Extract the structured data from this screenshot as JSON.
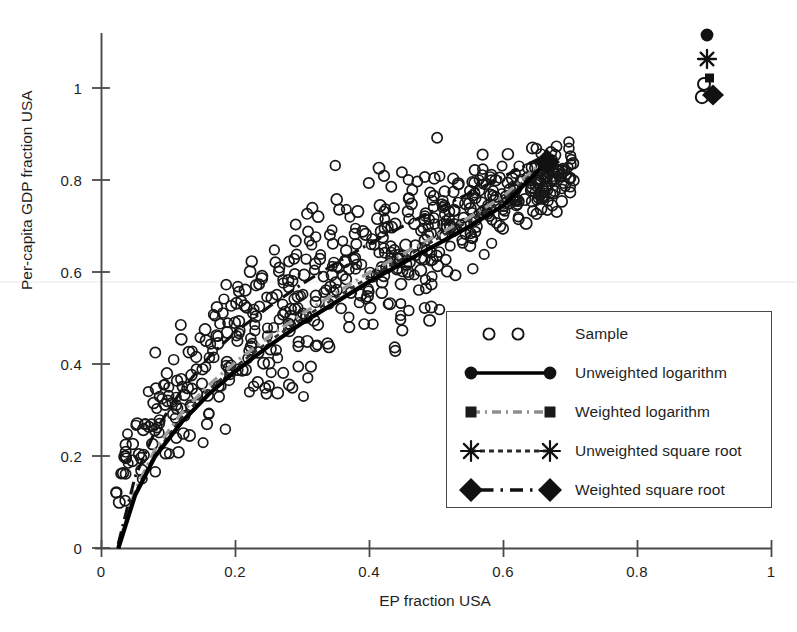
{
  "chart_data": {
    "type": "scatter",
    "title": "",
    "xlabel": "EP fraction USA",
    "ylabel": "Per-capita GDP fraction USA",
    "xlim": [
      0,
      1
    ],
    "ylim": [
      0,
      1.15
    ],
    "xticks": [
      "0",
      "0.2",
      "0.4",
      "0.6",
      "0.8",
      "1"
    ],
    "xtick_values": [
      0,
      0.2,
      0.4,
      0.6,
      0.8,
      1
    ],
    "yticks": [
      "0",
      "0.2",
      "0.4",
      "0.6",
      "0.8",
      "1"
    ],
    "ytick_values": [
      0,
      0.2,
      0.4,
      0.6,
      0.8,
      1
    ],
    "grid": false,
    "legend_position": "center-right",
    "series": [
      {
        "name": "Sample",
        "type": "scatter",
        "marker": "open-circle",
        "color": "#111111",
        "n_points": 620,
        "x_range": [
          0.012,
          0.705
        ],
        "y_range": [
          0.02,
          0.91
        ],
        "description": "Cloud of open circles rising concavely from near the origin to about (0.66, 0.85), widening in vertical spread between x=0.1 and x=0.55"
      },
      {
        "name": "Unweighted logarithm",
        "type": "line",
        "marker": "filled-circle",
        "linestyle": "solid",
        "color": "#000000",
        "x": [
          0.025,
          0.05,
          0.08,
          0.12,
          0.16,
          0.2,
          0.25,
          0.3,
          0.35,
          0.4,
          0.45,
          0.5,
          0.55,
          0.6,
          0.655
        ],
        "y": [
          0.0,
          0.115,
          0.2,
          0.275,
          0.335,
          0.385,
          0.44,
          0.49,
          0.535,
          0.58,
          0.62,
          0.66,
          0.7,
          0.745,
          0.825
        ]
      },
      {
        "name": "Weighted logarithm",
        "type": "line",
        "marker": "small-square",
        "linestyle": "dash-dot-light",
        "color": "#9a9a9a",
        "x": [
          0.025,
          0.05,
          0.08,
          0.12,
          0.16,
          0.2,
          0.25,
          0.3,
          0.35,
          0.4,
          0.45,
          0.5,
          0.55,
          0.6,
          0.655
        ],
        "y": [
          0.005,
          0.125,
          0.215,
          0.295,
          0.355,
          0.405,
          0.46,
          0.51,
          0.555,
          0.6,
          0.64,
          0.68,
          0.72,
          0.765,
          0.835
        ]
      },
      {
        "name": "Unweighted square root",
        "type": "line",
        "marker": "asterisk",
        "linestyle": "fine-dash",
        "color": "#2a2a2a",
        "x": [
          0.025,
          0.05,
          0.08,
          0.12,
          0.16,
          0.2,
          0.25,
          0.3,
          0.35,
          0.4,
          0.45,
          0.5,
          0.55,
          0.6,
          0.655
        ],
        "y": [
          0.0,
          0.12,
          0.205,
          0.285,
          0.345,
          0.395,
          0.45,
          0.5,
          0.545,
          0.59,
          0.63,
          0.672,
          0.712,
          0.755,
          0.832
        ]
      },
      {
        "name": "Weighted square root",
        "type": "line",
        "marker": "filled-diamond",
        "linestyle": "dash-dot",
        "color": "#111111",
        "x": [
          0.025,
          0.05,
          0.08,
          0.12,
          0.16,
          0.2,
          0.25,
          0.3,
          0.35,
          0.4,
          0.45,
          0.5,
          0.55,
          0.6,
          0.665
        ],
        "y": [
          0.01,
          0.155,
          0.255,
          0.345,
          0.415,
          0.47,
          0.525,
          0.575,
          0.62,
          0.662,
          0.7,
          0.737,
          0.772,
          0.808,
          0.855
        ]
      }
    ],
    "reference_markers": [
      {
        "name": "Unweighted logarithm",
        "marker": "filled-circle",
        "x": 0.985,
        "y": 1.115
      },
      {
        "name": "Unweighted square root",
        "marker": "asterisk",
        "x": 0.985,
        "y": 1.065
      },
      {
        "name": "Weighted logarithm",
        "marker": "small-square",
        "x": 0.99,
        "y": 1.015
      },
      {
        "name": "Sample",
        "marker": "open-circle",
        "x": 0.982,
        "y": 1.005
      },
      {
        "name": "Weighted square root",
        "marker": "filled-diamond",
        "x": 0.995,
        "y": 0.975
      },
      {
        "name": "Sample",
        "marker": "open-circle",
        "x": 0.978,
        "y": 0.965
      }
    ]
  },
  "axes": {
    "x_title": "EP fraction USA",
    "y_title": "Per-capita GDP fraction USA",
    "x_tick_labels": [
      "0",
      "0.2",
      "0.4",
      "0.6",
      "0.8",
      "1"
    ],
    "y_tick_labels": [
      "0",
      "0.2",
      "0.4",
      "0.6",
      "0.8",
      "1"
    ]
  },
  "legend": {
    "entries": [
      {
        "label": "Sample",
        "key": "open-circle-pair"
      },
      {
        "label": "Unweighted logarithm",
        "key": "solid-line-filled-circles"
      },
      {
        "label": "Weighted logarithm",
        "key": "dashdot-gray-squares"
      },
      {
        "label": "Unweighted square root",
        "key": "dashed-asterisks"
      },
      {
        "label": "Weighted square root",
        "key": "dashdot-diamonds"
      }
    ]
  },
  "colors": {
    "axis": "#4a4a4a",
    "solid_curve": "#000000",
    "gray_curve": "#9a9a9a",
    "marker_fill": "#111111",
    "text": "#1f1f1f"
  }
}
